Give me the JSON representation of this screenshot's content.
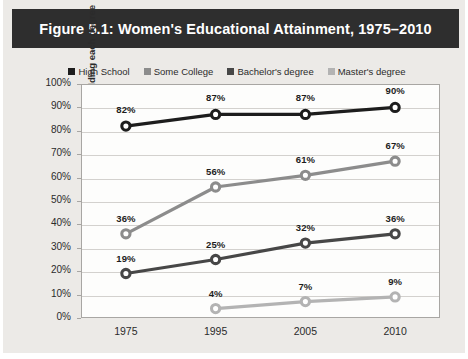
{
  "figure": {
    "title": "Figure 5.1: Women's Educational Attainment, 1975–2010"
  },
  "colors": {
    "title_bar_bg": "#2e2e2e",
    "page_bg": "#eceae7",
    "plot_bg": "#fdfdfc",
    "grid": "#d3d1ce",
    "frame": "#a8a6a3",
    "high_school": "#1d1d1d",
    "some_college": "#8c8c8c",
    "bachelors": "#474747",
    "masters": "#b3b3b3"
  },
  "chart_data": {
    "type": "line",
    "title": "Figure 5.1: Women's Educational Attainment, 1975–2010",
    "xlabel": "",
    "ylabel": "Percentage of women holding each degree",
    "categories": [
      "1975",
      "1995",
      "2005",
      "2010"
    ],
    "ylim": [
      0,
      100
    ],
    "ytick_labels": [
      "0%",
      "10%",
      "20%",
      "30%",
      "40%",
      "50%",
      "60%",
      "70%",
      "80%",
      "90%",
      "100%"
    ],
    "ytick_values": [
      0,
      10,
      20,
      30,
      40,
      50,
      60,
      70,
      80,
      90,
      100
    ],
    "grid": true,
    "legend_position": "top",
    "series": [
      {
        "name": "High School",
        "color": "#1d1d1d",
        "values": [
          82,
          87,
          87,
          90
        ],
        "labels": [
          "82%",
          "87%",
          "87%",
          "90%"
        ]
      },
      {
        "name": "Some College",
        "color": "#8c8c8c",
        "values": [
          36,
          56,
          61,
          67
        ],
        "labels": [
          "36%",
          "56%",
          "61%",
          "67%"
        ]
      },
      {
        "name": "Bachelor's degree",
        "color": "#474747",
        "values": [
          19,
          25,
          32,
          36
        ],
        "labels": [
          "19%",
          "25%",
          "32%",
          "36%"
        ]
      },
      {
        "name": "Master's degree",
        "color": "#b3b3b3",
        "values": [
          null,
          4,
          7,
          9
        ],
        "labels": [
          null,
          "4%",
          "7%",
          "9%"
        ]
      }
    ]
  }
}
